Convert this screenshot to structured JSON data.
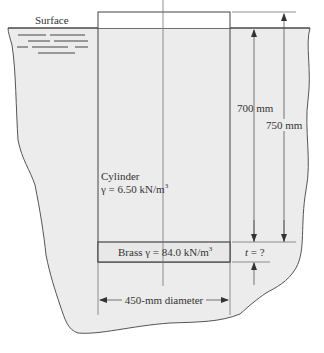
{
  "figure": {
    "surface_label": "Surface",
    "cylinder_label": "Cylinder",
    "cylinder_gamma": "γ = 6.50 kN/m",
    "cylinder_gamma_exp": "3",
    "brass_label": "Brass γ = 84.0 kN/m",
    "brass_label_exp": "3",
    "dim_700": "700 mm",
    "dim_750": "750 mm",
    "dim_t_var": "t",
    "dim_t_rest": " = ?",
    "dim_diameter": "450-mm diameter"
  },
  "colors": {
    "fluid_fill": "#ececec",
    "outline": "#444444",
    "dim_line": "#666666",
    "text": "#333333"
  }
}
